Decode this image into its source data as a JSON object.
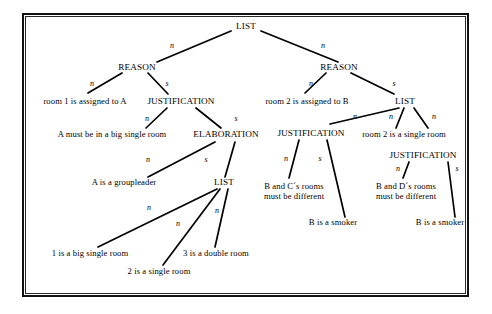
{
  "diagram": {
    "frame_color": "#111111",
    "text_color": "#000000",
    "background": "#ffffff",
    "nodes": {
      "root_list": "LIST",
      "reason_left": "REASON",
      "reason_right": "REASON",
      "leaf_room1": "room 1 is assigned to A",
      "justification_left": "JUSTIFICATION",
      "leaf_room2": "room 2 is assigned to B",
      "list_right": "LIST",
      "leaf_a_must": "A must be in a big single room",
      "elaboration": "ELABORATION",
      "justification_mid": "JUSTIFICATION",
      "leaf_room2_single": "room 2 is a single room",
      "justification_far_right": "JUSTIFICATION",
      "leaf_a_groupleader": "A is a groupleader",
      "list_bottom": "LIST",
      "leaf_bc_line1": "B and C´s rooms",
      "leaf_bc_line2": "must be different",
      "leaf_bd_line1": "B and D´s rooms",
      "leaf_bd_line2": "must be different",
      "leaf_smoker_mid": "B is a smoker",
      "leaf_smoker_right": "B is a smoker",
      "leaf_1big": "1 is a big single room",
      "leaf_3double": "3 is a double room",
      "leaf_2single": "2 is a single room"
    },
    "edge_labels": {
      "root_n_left": "n",
      "root_n_right": "n",
      "reasonL_n": "n",
      "reasonL_s": "s",
      "reasonR_n": "n",
      "reasonR_s": "s",
      "justL_n": "n",
      "justL_s": "s",
      "elab_n": "n",
      "elab_s": "s",
      "listR_n1": "n",
      "listR_n2": "n",
      "listR_n3": "n",
      "justM_n": "n",
      "justM_s": "s",
      "justFR_n": "n",
      "justFR_s": "s",
      "listB_n1": "n",
      "listB_n2": "n",
      "listB_n3": "n"
    }
  }
}
